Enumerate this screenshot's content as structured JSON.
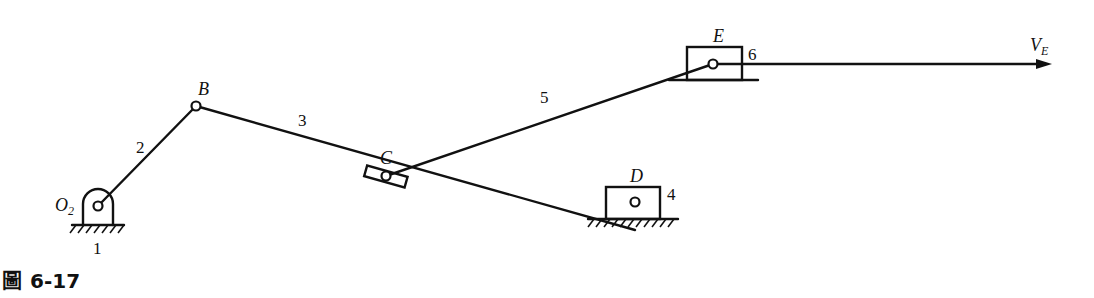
{
  "figure": {
    "caption_prefix": "圖",
    "caption_number": "6-17"
  },
  "points": {
    "O2": {
      "label": "O",
      "sub": "2"
    },
    "B": {
      "label": "B"
    },
    "C": {
      "label": "C"
    },
    "D": {
      "label": "D"
    },
    "E": {
      "label": "E"
    }
  },
  "links": {
    "ground": "1",
    "crank": "2",
    "link3": "3",
    "slider_d": "4",
    "link5": "5",
    "slider_e": "6"
  },
  "velocity": {
    "label": "V",
    "sub": "E"
  }
}
